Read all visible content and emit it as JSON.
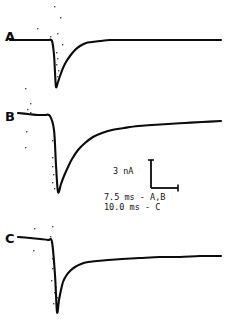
{
  "figure": {
    "panels": [
      {
        "id": "A",
        "label": "A"
      },
      {
        "id": "B",
        "label": "B"
      },
      {
        "id": "C",
        "label": "C"
      }
    ],
    "calibration": {
      "amplitude_label": "3 nA",
      "time_label_ab": "7.5 ms - A,B",
      "time_label_c": "10.0 ms - C"
    },
    "colors": {
      "ink": "#0b0b0b",
      "background": "#ffffff"
    }
  },
  "chart_data": {
    "type": "line",
    "title": "",
    "xlabel": "",
    "ylabel": "",
    "grid": false,
    "legend": "none",
    "axis_units": {
      "y": "nA",
      "x": "ms"
    },
    "scale_bar": {
      "amplitude": 3,
      "amplitude_unit": "nA",
      "time_ab": 7.5,
      "time_c": 10.0,
      "time_unit": "ms",
      "amplitude_label": "3 nA",
      "time_label_ab": "7.5 ms - A,B",
      "time_label_c": "10.0 ms - C",
      "vertical_px": 28,
      "horizontal_px": 27
    },
    "series": [
      {
        "name": "A",
        "time_per_division_ms": 7.5,
        "baseline_y": 40,
        "peak_y": 87,
        "step_x": 55,
        "tau_px": 13,
        "end_x": 221,
        "points": [
          [
            10,
            40
          ],
          [
            20,
            40
          ],
          [
            30,
            40
          ],
          [
            40,
            40
          ],
          [
            48,
            40
          ],
          [
            52,
            41
          ],
          [
            54,
            55
          ],
          [
            55,
            72
          ],
          [
            56,
            87
          ],
          [
            58,
            82
          ],
          [
            60,
            76
          ],
          [
            63,
            68
          ],
          [
            66,
            62
          ],
          [
            70,
            56
          ],
          [
            75,
            50
          ],
          [
            80,
            46
          ],
          [
            86,
            43
          ],
          [
            92,
            42
          ],
          [
            100,
            41
          ],
          [
            110,
            40
          ],
          [
            125,
            40
          ],
          [
            145,
            40
          ],
          [
            170,
            40
          ],
          [
            195,
            40
          ],
          [
            221,
            40
          ]
        ]
      },
      {
        "name": "B",
        "time_per_division_ms": 7.5,
        "baseline_y": 120,
        "peak_y": 192,
        "step_x": 57,
        "tau_px": 34,
        "end_x": 221,
        "points": [
          [
            18,
            113
          ],
          [
            28,
            114
          ],
          [
            38,
            115
          ],
          [
            45,
            115
          ],
          [
            50,
            116
          ],
          [
            54,
            130
          ],
          [
            56,
            165
          ],
          [
            58,
            192
          ],
          [
            61,
            184
          ],
          [
            64,
            176
          ],
          [
            68,
            167
          ],
          [
            72,
            159
          ],
          [
            78,
            150
          ],
          [
            85,
            143
          ],
          [
            93,
            137
          ],
          [
            102,
            133
          ],
          [
            112,
            130
          ],
          [
            124,
            128
          ],
          [
            138,
            126
          ],
          [
            152,
            125
          ],
          [
            168,
            124
          ],
          [
            185,
            123
          ],
          [
            202,
            122
          ],
          [
            221,
            121
          ]
        ]
      },
      {
        "name": "C",
        "time_per_division_ms": 10.0,
        "baseline_y": 262,
        "peak_y": 312,
        "step_x": 57,
        "tau_px": 11,
        "end_x": 221,
        "points": [
          [
            18,
            237
          ],
          [
            30,
            238
          ],
          [
            40,
            239
          ],
          [
            48,
            240
          ],
          [
            52,
            242
          ],
          [
            55,
            275
          ],
          [
            57,
            312
          ],
          [
            59,
            300
          ],
          [
            61,
            290
          ],
          [
            63,
            282
          ],
          [
            66,
            276
          ],
          [
            70,
            271
          ],
          [
            75,
            267
          ],
          [
            81,
            264
          ],
          [
            88,
            262
          ],
          [
            97,
            261
          ],
          [
            108,
            260
          ],
          [
            122,
            259
          ],
          [
            140,
            258
          ],
          [
            160,
            257
          ],
          [
            180,
            257
          ],
          [
            200,
            256
          ],
          [
            221,
            256
          ]
        ]
      }
    ]
  }
}
